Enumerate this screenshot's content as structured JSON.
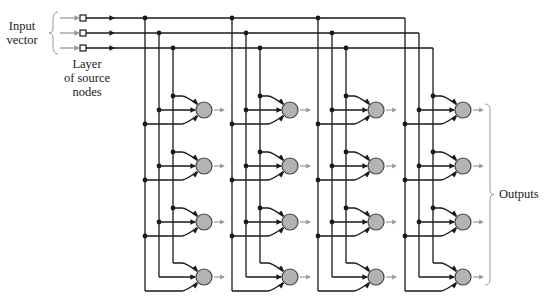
{
  "diagram": {
    "type": "single-layer feedforward network (lattice)",
    "labels": {
      "input_vector": [
        "Input",
        "vector"
      ],
      "source_layer": [
        "Layer",
        "of source",
        "nodes"
      ],
      "outputs": "Outputs"
    },
    "colors": {
      "line": "#1a1a1a",
      "input_arrow": "#9a9a9a",
      "neuron_fill": "#b3b3b3",
      "neuron_stroke": "#444444",
      "output_arrow": "#9a9a9a",
      "brace": "#9a9a9a"
    },
    "inputs": {
      "count": 3,
      "y": [
        18,
        33,
        48
      ],
      "source_node_x": 83
    },
    "groups": [
      {
        "verticals_x": [
          145,
          159,
          173
        ],
        "neuron_x": 204
      },
      {
        "verticals_x": [
          232,
          246,
          260
        ],
        "neuron_x": 290
      },
      {
        "verticals_x": [
          318,
          332,
          346
        ],
        "neuron_x": 376
      },
      {
        "verticals_x": [
          405,
          419,
          433
        ],
        "neuron_x": 463
      }
    ],
    "neuron_rows_y": [
      110,
      166,
      222,
      277
    ],
    "neuron_radius": 8,
    "branch_offset": 14
  }
}
